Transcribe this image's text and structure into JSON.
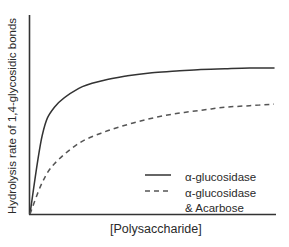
{
  "chart_data": {
    "type": "line",
    "title": "",
    "xlabel": "[Polysaccharide]",
    "ylabel": "Hydrolysis rate of 1,4-glycosidic bonds",
    "x_ticks": [],
    "y_ticks": [],
    "grid": false,
    "legend_position": "lower right",
    "x": [
      0,
      0.05,
      0.1,
      0.2,
      0.3,
      0.4,
      0.5,
      0.6,
      0.7,
      0.8,
      0.9,
      1.0
    ],
    "series": [
      {
        "name": "α-glucosidase",
        "style": "solid",
        "color": "#333333",
        "values": [
          0,
          0.5,
          0.68,
          0.8,
          0.85,
          0.88,
          0.9,
          0.91,
          0.92,
          0.925,
          0.93,
          0.93
        ]
      },
      {
        "name": "α-glucosidase & Acarbose",
        "style": "dashed",
        "color": "#555555",
        "values": [
          0,
          0.2,
          0.32,
          0.45,
          0.52,
          0.57,
          0.61,
          0.64,
          0.66,
          0.68,
          0.69,
          0.7
        ]
      }
    ]
  },
  "axes": {
    "xlabel": "[Polysaccharide]",
    "ylabel": "Hydrolysis rate of 1,4-glycosidic bonds"
  },
  "legend": {
    "items": [
      {
        "label": "α-glucosidase",
        "style": "solid"
      },
      {
        "label": "α-glucosidase",
        "sub": "& Acarbose",
        "style": "dashed"
      }
    ]
  }
}
